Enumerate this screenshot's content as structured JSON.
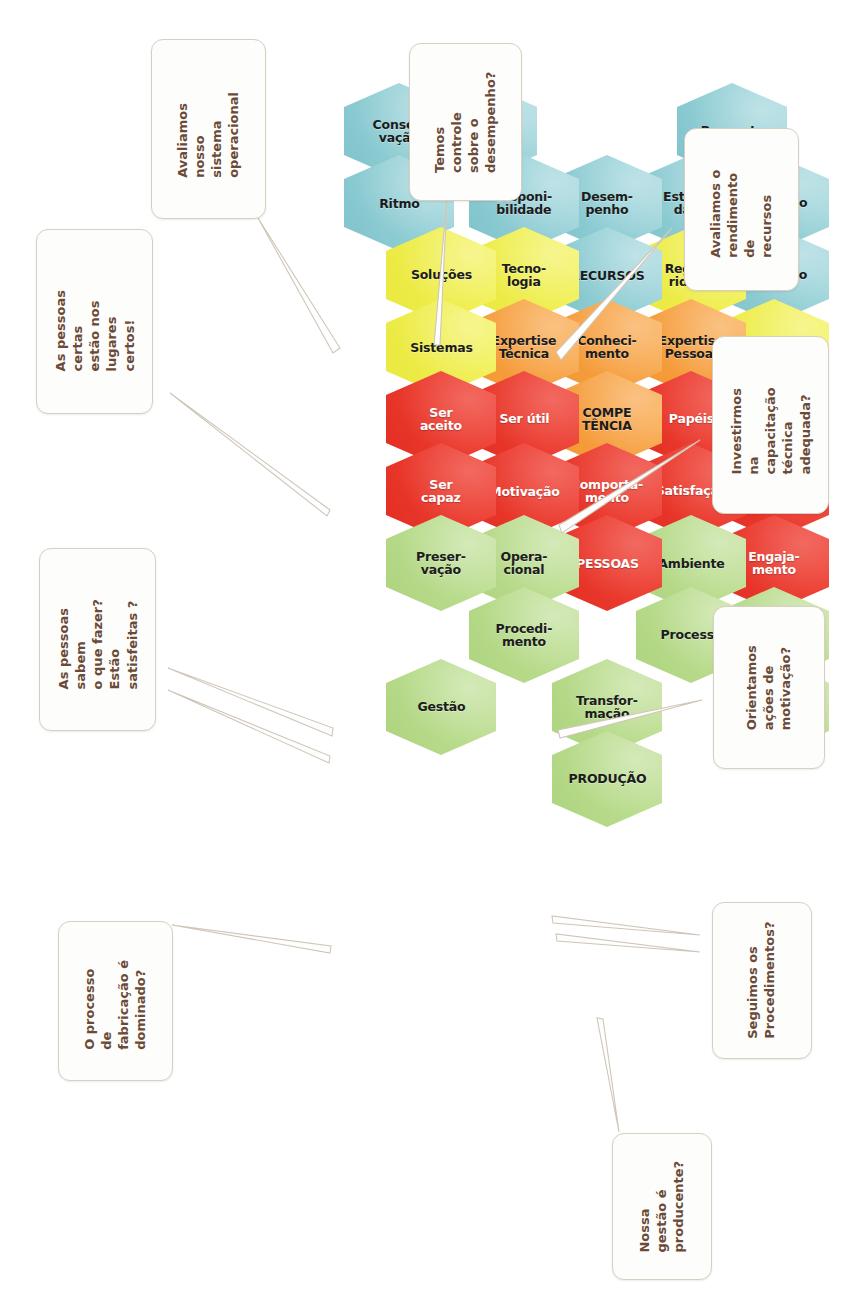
{
  "palette": {
    "blue": "#93cfd6",
    "yellow": "#efee4d",
    "orange": "#f7a244",
    "red": "#ec3b2f",
    "green": "#b9dc8d",
    "callout_border": "#d8cfc2",
    "callout_text": "#6b4a38",
    "page_background": "#ffffff"
  },
  "hexagons": [
    {
      "id": "aplicacao",
      "label": "Aplicação",
      "color": "blue"
    },
    {
      "id": "resposta",
      "label": "Resposta",
      "color": "blue"
    },
    {
      "id": "limitacao",
      "label": "Limitação",
      "color": "blue"
    },
    {
      "id": "operacao",
      "label": "Operação",
      "color": "blue"
    },
    {
      "id": "estabilidade",
      "label": "Estabili-\ndade",
      "color": "blue"
    },
    {
      "id": "desempenho",
      "label": "Desem-\npenho",
      "color": "blue"
    },
    {
      "id": "disponibilidade",
      "label": "Disponi-\nbilidade",
      "color": "blue"
    },
    {
      "id": "conservacao",
      "label": "Conser-\nvação",
      "color": "blue"
    },
    {
      "id": "agilidade",
      "label": "Agilidade",
      "color": "yellow"
    },
    {
      "id": "regularidade",
      "label": "Regula-\nridade",
      "color": "yellow"
    },
    {
      "id": "recursos",
      "label": "RECURSOS",
      "color": "blue"
    },
    {
      "id": "tecnologia",
      "label": "Tecno-\nlogia",
      "color": "yellow"
    },
    {
      "id": "ritmo",
      "label": "Ritmo",
      "color": "blue"
    },
    {
      "id": "habilidade",
      "label": "Habili-\ndade",
      "color": "yellow"
    },
    {
      "id": "expertise-pessoal",
      "label": "Expertise\nPessoal",
      "color": "orange"
    },
    {
      "id": "conhecimento",
      "label": "Conheci-\nmento",
      "color": "orange"
    },
    {
      "id": "expertise-tecnica",
      "label": "Expertise\nTécnica",
      "color": "orange"
    },
    {
      "id": "solucoes",
      "label": "Soluções",
      "color": "yellow"
    },
    {
      "id": "responsabilidades",
      "label": "Responsa-\nbilidades",
      "color": "red"
    },
    {
      "id": "papeis",
      "label": "Papéis",
      "color": "red"
    },
    {
      "id": "competencia",
      "label": "COMPE\nTÊNCIA",
      "color": "orange"
    },
    {
      "id": "ser-util",
      "label": "Ser útil",
      "color": "red"
    },
    {
      "id": "sistemas",
      "label": "Sistemas",
      "color": "yellow"
    },
    {
      "id": "engajamento",
      "label": "Engaja-\nmento",
      "color": "red"
    },
    {
      "id": "satisfacao",
      "label": "Satisfação",
      "color": "red"
    },
    {
      "id": "comportamento",
      "label": "Comporta-\nmento",
      "color": "red"
    },
    {
      "id": "motivacao",
      "label": "Motivação",
      "color": "red"
    },
    {
      "id": "ser-aceito",
      "label": "Ser\naceito",
      "color": "red"
    },
    {
      "id": "insumos",
      "label": "Insumos",
      "color": "green"
    },
    {
      "id": "ambiente",
      "label": "Ambiente",
      "color": "green"
    },
    {
      "id": "pessoas",
      "label": "PESSOAS",
      "color": "red"
    },
    {
      "id": "operacional",
      "label": "Opera-\ncional",
      "color": "green"
    },
    {
      "id": "ser-capaz",
      "label": "Ser\ncapaz",
      "color": "red"
    },
    {
      "id": "evolucao",
      "label": "Evolução",
      "color": "green"
    },
    {
      "id": "processo",
      "label": "Processo",
      "color": "green"
    },
    {
      "id": "transformacao",
      "label": "Transfor-\nmação",
      "color": "green"
    },
    {
      "id": "procedimento",
      "label": "Procedi-\nmento",
      "color": "green"
    },
    {
      "id": "preservacao",
      "label": "Preser-\nvação",
      "color": "green"
    },
    {
      "id": "producao",
      "label": "PRODUÇÃO",
      "color": "green"
    },
    {
      "id": "gestao",
      "label": "Gestão",
      "color": "green"
    }
  ],
  "callouts": [
    {
      "id": "callout-sistema-operacional",
      "text": "Avaliamos nosso\nsistema\noperacional"
    },
    {
      "id": "callout-pessoas-certas",
      "text": "As pessoas certas\nestão nos lugares\ncertos!"
    },
    {
      "id": "callout-controle-desempenho",
      "text": "Temos  controle\nsobre o\ndesempenho?"
    },
    {
      "id": "callout-rendimento-recursos",
      "text": "Avaliamos o\nrendimento de\nrecursos"
    },
    {
      "id": "callout-capacitacao-tecnica",
      "text": "Investirmos na\ncapacitação\ntécnica\nadequada?"
    },
    {
      "id": "callout-pessoas-sabem",
      "text": "As pessoas sabem\no que fazer?  Estão\nsatisfeitas ?"
    },
    {
      "id": "callout-acoes-motivacao",
      "text": "Orientamos\nações de\nmotivação?"
    },
    {
      "id": "callout-processo-fabricacao",
      "text": "O processo de\nfabricação é\ndominado?"
    },
    {
      "id": "callout-procedimentos",
      "text": "Seguimos os\nProcedimentos?"
    },
    {
      "id": "callout-gestao-producente",
      "text": "Nossa gestão é\nproducente?"
    }
  ]
}
